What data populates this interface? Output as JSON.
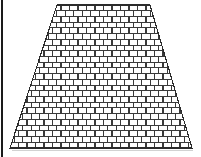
{
  "image": {
    "title": "Trapezoidal brick wall",
    "width": 201,
    "height": 157,
    "background_color": "#ffffff"
  },
  "left_margin_rule": {
    "name": "left-edge-rule",
    "color": "#1a1a1a",
    "x": 2,
    "y_top": 0,
    "y_bottom": 157,
    "thickness": 2
  },
  "shape": {
    "name": "trapezoid",
    "type": "isosceles-trapezoid",
    "outline_color": "#2b2b2b",
    "outline_width": 1.1,
    "fill_color": "#ffffff",
    "top_left_x": 57,
    "top_right_x": 150,
    "bottom_left_x": 10,
    "bottom_right_x": 192,
    "top_y": 5,
    "bottom_y": 148,
    "top_width": 93,
    "bottom_width": 182,
    "height": 143
  },
  "brick_pattern": {
    "name": "running-bond",
    "bond": "running bond (half-offset stretcher)",
    "mortar_color": "#3a3a3a",
    "mortar_width": 1.05,
    "brick_face_color": "#ffffff",
    "row_count": 25,
    "row_height": 5.72,
    "brick_width": 8.5,
    "offset_fraction": 0.5,
    "shadow_color": "#c9c9c9"
  },
  "ground_shadow": {
    "name": "base-shadow",
    "color": "#d2d2d2",
    "y": 150,
    "x_start": 12,
    "x_end": 193,
    "thickness": 1.2
  },
  "chart_data": {
    "type": "diagram",
    "vertices": [
      {
        "label": "top-left",
        "x": 57,
        "y": 5
      },
      {
        "label": "top-right",
        "x": 150,
        "y": 5
      },
      {
        "label": "bottom-right",
        "x": 192,
        "y": 148
      },
      {
        "label": "bottom-left",
        "x": 10,
        "y": 148
      }
    ],
    "rows": 25,
    "row_height_px": 5.72,
    "brick_width_px": 8.5,
    "bricks_per_row_top": 11,
    "bricks_per_row_bottom": 21,
    "xlabel": "",
    "ylabel": "",
    "grid": false,
    "legend": "none"
  }
}
